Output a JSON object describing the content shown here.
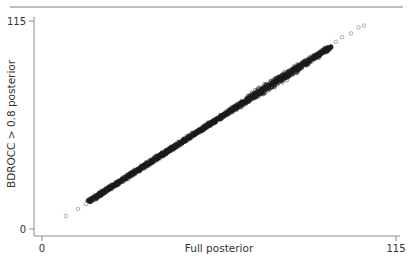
{
  "chart_data": {
    "type": "scatter",
    "title": "",
    "xlabel": "Full posterior",
    "ylabel": "BDROCC > 0.8 posterior",
    "xlim": [
      0,
      115
    ],
    "ylim": [
      0,
      115
    ],
    "x_ticks": [
      0,
      115
    ],
    "y_ticks": [
      0,
      115
    ],
    "x_tick_labels": [
      "0",
      "115"
    ],
    "y_tick_labels": [
      "0",
      "115"
    ],
    "grid": false,
    "legend": null,
    "marker": "hollow-circle",
    "series": [
      {
        "name": "points",
        "description": "Dense band of many thousands of overlapping points lying along y = x (slope ~1.1)",
        "dense_band": {
          "x_start": 15,
          "y_start": 15,
          "x_end": 94,
          "y_end": 101,
          "half_width": 2
        },
        "sparse_points": [
          {
            "x": 7.8,
            "y": 7.2
          },
          {
            "x": 11.7,
            "y": 11.1
          },
          {
            "x": 14.3,
            "y": 13.8
          },
          {
            "x": 95.5,
            "y": 103.5
          },
          {
            "x": 97.5,
            "y": 106.0
          },
          {
            "x": 100.4,
            "y": 108.1
          },
          {
            "x": 102.8,
            "y": 111.4
          },
          {
            "x": 104.6,
            "y": 112.5
          }
        ]
      }
    ]
  },
  "colors": {
    "axis": "#8c8c8c",
    "points": "#1a1a1a",
    "sparse_points": "#9a9a9a",
    "top_rule": "#7a7a7a"
  }
}
